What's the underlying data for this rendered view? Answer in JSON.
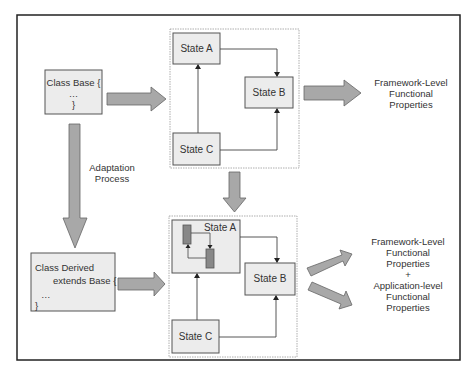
{
  "colors": {
    "box_fill": "#ececec",
    "box_border": "#555555",
    "arrow_fill": "#a8a8a8",
    "arrow_border": "#666666",
    "inner_rect_fill": "#888888",
    "frame_border": "#999999",
    "outer_border": "#222222"
  },
  "class_base": {
    "line1": "Class Base {",
    "line2": "…",
    "line3": "}"
  },
  "class_derived": {
    "line1": "Class Derived",
    "line2": "extends Base {",
    "line3": "…",
    "line4": "}"
  },
  "adaptation": {
    "line1": "Adaptation",
    "line2": "Process"
  },
  "top_machine": {
    "state_a": "State A",
    "state_b": "State B",
    "state_c": "State C"
  },
  "bottom_machine": {
    "state_a": "State A",
    "state_b": "State B",
    "state_c": "State C"
  },
  "top_output": {
    "line1": "Framework-Level",
    "line2": "Functional",
    "line3": "Properties"
  },
  "bottom_output": {
    "line1": "Framework-Level",
    "line2": "Functional",
    "line3": "Properties",
    "line4": "+",
    "line5": "Application-level",
    "line6": "Functional",
    "line7": "Properties"
  }
}
